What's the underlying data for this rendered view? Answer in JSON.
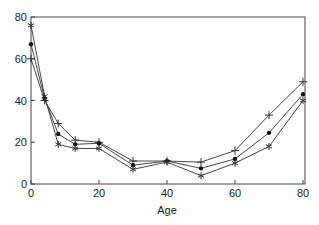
{
  "chart_data": {
    "type": "line",
    "title": "",
    "xlabel": "Age",
    "ylabel": "",
    "xlim": [
      0,
      80
    ],
    "ylim": [
      0,
      80
    ],
    "xticks": [
      0,
      20,
      40,
      60,
      80
    ],
    "yticks": [
      0,
      20,
      40,
      60,
      80
    ],
    "grid": false,
    "legend": null,
    "x": [
      0,
      4,
      8,
      13,
      20,
      30,
      40,
      50,
      60,
      70,
      80
    ],
    "series": [
      {
        "name": "plus-marker",
        "marker": "plus",
        "values": [
          60,
          40,
          29,
          21,
          20,
          11,
          11,
          10.5,
          16,
          33,
          49
        ]
      },
      {
        "name": "dot-marker",
        "marker": "dot",
        "values": [
          67,
          41,
          24,
          19,
          19.5,
          9,
          11,
          7.5,
          12,
          24.5,
          43
        ]
      },
      {
        "name": "star-marker",
        "marker": "star",
        "values": [
          76,
          42,
          19,
          17,
          17,
          7,
          10.5,
          4,
          10,
          18,
          40
        ]
      }
    ]
  },
  "colors": {
    "line": "#333333",
    "axis": "#444444"
  }
}
